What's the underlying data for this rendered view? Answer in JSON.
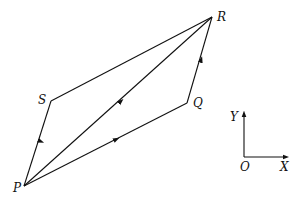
{
  "diagram": {
    "points": {
      "P": {
        "label": "P",
        "x": 24,
        "y": 186
      },
      "S": {
        "label": "S",
        "x": 51,
        "y": 101
      },
      "R": {
        "label": "R",
        "x": 212,
        "y": 17
      },
      "Q": {
        "label": "Q",
        "x": 187,
        "y": 103
      }
    },
    "segments": [
      {
        "from": "P",
        "to": "S",
        "arrow": true
      },
      {
        "from": "S",
        "to": "R",
        "arrow": false
      },
      {
        "from": "P",
        "to": "R",
        "arrow": true
      },
      {
        "from": "P",
        "to": "Q",
        "arrow": true
      },
      {
        "from": "Q",
        "to": "R",
        "arrow": true
      }
    ],
    "axes": {
      "origin_label": "O",
      "x_label": "X",
      "y_label": "Y"
    }
  }
}
